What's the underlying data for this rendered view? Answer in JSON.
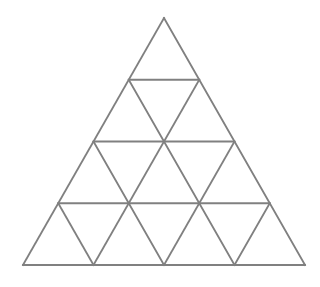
{
  "figure": {
    "name": "triangular-grid",
    "background_color": "#ffffff",
    "line_color": "#808080",
    "line_width": 1.8,
    "rows": 4,
    "counts": {
      "small_triangles_total": 16,
      "upward_triangles": 10,
      "downward_triangles": 6,
      "rows_triangle_counts": [
        1,
        3,
        5,
        7
      ]
    },
    "geometry": {
      "apex": [
        164,
        18
      ],
      "bottom_left": [
        23,
        265
      ],
      "bottom_right": [
        303,
        265
      ],
      "row_y": [
        18,
        79,
        141,
        203,
        265
      ],
      "half_width_step": 35.25,
      "row_half_widths": [
        0,
        35.25,
        70.5,
        105.75,
        141
      ]
    },
    "lines": {
      "horizontal": [
        {
          "name": "row-1-base",
          "x1": 128.75,
          "y1": 79.75,
          "x2": 199.25,
          "y2": 79.75
        },
        {
          "name": "row-2-base",
          "x1": 93.5,
          "y1": 141.5,
          "x2": 234.5,
          "y2": 141.5
        },
        {
          "name": "row-3-base",
          "x1": 58.25,
          "y1": 203.25,
          "x2": 269.75,
          "y2": 203.25
        },
        {
          "name": "row-4-base",
          "x1": 23,
          "y1": 265,
          "x2": 305,
          "y2": 265
        }
      ],
      "left_leaning": [
        {
          "name": "left-edge",
          "x1": 164,
          "y1": 18,
          "x2": 23,
          "y2": 265
        },
        {
          "name": "left-parallel-1",
          "x1": 199.25,
          "y1": 79.75,
          "x2": 93.5,
          "y2": 265
        },
        {
          "name": "left-parallel-2",
          "x1": 234.5,
          "y1": 141.5,
          "x2": 164,
          "y2": 265
        },
        {
          "name": "left-parallel-3",
          "x1": 269.75,
          "y1": 203.25,
          "x2": 234.5,
          "y2": 265
        }
      ],
      "right_leaning": [
        {
          "name": "right-edge",
          "x1": 164,
          "y1": 18,
          "x2": 305,
          "y2": 265
        },
        {
          "name": "right-parallel-1",
          "x1": 128.75,
          "y1": 79.75,
          "x2": 234.5,
          "y2": 265
        },
        {
          "name": "right-parallel-2",
          "x1": 93.5,
          "y1": 141.5,
          "x2": 164,
          "y2": 265
        },
        {
          "name": "right-parallel-3",
          "x1": 58.25,
          "y1": 203.25,
          "x2": 93.5,
          "y2": 265
        }
      ]
    }
  }
}
